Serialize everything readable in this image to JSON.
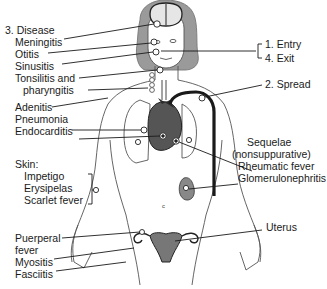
{
  "diagram": {
    "colors": {
      "line": "#1a1a1a",
      "outline": "#555555",
      "hair": "#9a9a9a",
      "brain": "#e6e6e6",
      "organ_dark": "#2b2b2b",
      "organ_mid": "#777777",
      "skin": "#ffffff"
    },
    "labels": {
      "disease_header": "3. Disease",
      "meningitis": "Meningitis",
      "otitis": "Otitis",
      "sinusitis": "Sinusitis",
      "tonsilitis": "Tonsilitis and",
      "pharyngitis": "pharyngitis",
      "entry": "1. Entry",
      "exit": "4. Exit",
      "spread": "2. Spread",
      "adenitis": "Adenitis",
      "pneumonia": "Pneumonia",
      "endocarditis": "Endocarditis",
      "skin_header": "Skin:",
      "impetigo": "Impetigo",
      "erysipelas": "Erysipelas",
      "scarlet_fever": "Scarlet fever",
      "sequelae": "Sequelae",
      "nonsuppurative": "(nonsuppurative)",
      "rheumatic_fever": "Rheumatic fever",
      "glomerulonephritis": "Glomerulonephritis",
      "puerperal": "Puerperal",
      "fever": "fever",
      "myositis": "Myositis",
      "fasciitis": "Fasciitis",
      "uterus": "Uterus"
    },
    "groups": {
      "disease_sites": [
        "Meningitis",
        "Otitis",
        "Sinusitis",
        "Tonsilitis and pharyngitis",
        "Adenitis",
        "Pneumonia",
        "Endocarditis",
        "Puerperal fever",
        "Myositis",
        "Fasciitis"
      ],
      "skin": [
        "Impetigo",
        "Erysipelas",
        "Scarlet fever"
      ],
      "portals": [
        "1. Entry",
        "4. Exit"
      ],
      "spread": "2. Spread",
      "sequelae_nonsuppurative": [
        "Rheumatic fever",
        "Glomerulonephritis"
      ],
      "organ_label": "Uterus"
    }
  }
}
